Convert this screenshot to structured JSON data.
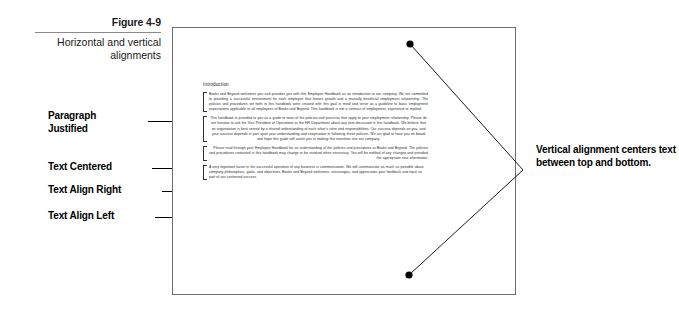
{
  "figure": {
    "number": "Figure 4-9",
    "title": "Horizontal and vertical alignments"
  },
  "callouts": {
    "left": [
      {
        "name": "paragraph-justified",
        "label": "Paragraph\nJustified"
      },
      {
        "name": "text-centered",
        "label": "Text Centered"
      },
      {
        "name": "text-align-right",
        "label": "Text Align Right"
      },
      {
        "name": "text-align-left",
        "label": "Text Align Left"
      }
    ],
    "right": {
      "label": "Vertical alignment centers text between top and bottom."
    }
  },
  "document": {
    "heading": "Introduction",
    "paragraphs": [
      {
        "alignment": "justify",
        "text": "Books and Beyond welcomes you and provides you with this Employee Handbook as an introduction to our company. We are committed to providing a successful environment for each employee that fosters growth and a mutually beneficial employment relationship. The policies and procedures set forth in this handbook were created with this goal in mind and serve as a guideline to basic employment expectations applicable to all employees of Books and Beyond. This handbook is not a contract of employment, expressed or implied."
      },
      {
        "alignment": "center",
        "text": "This handbook is provided to you as a guide to most of the policies and practices that apply to your employment relationship. Please do not hesitate to ask the Vice President of Operations or the HR Department about any item discussed in this handbook. We believe that an organization is best served by a shared understanding of each other's roles and responsibilities. Our success depends on you, and your success depends in part upon your understanding and cooperation in following these policies. We are glad to have you on board and hope this guide will assist you in making this transition into our company."
      },
      {
        "alignment": "right",
        "text": "Please read through your Employee Handbook for an understanding of the policies and procedures at Books and Beyond. The policies and procedures contained in this handbook may change or be revoked when necessary. You will be notified of any changes and provided the appropriate new information."
      },
      {
        "alignment": "left",
        "text": "A very important factor in the successful operation of any business is communication. We will communicate as much as possible about company philosophies, goals, and objectives. Books and Beyond welcomes, encourages, and appreciates your feedback and input as part of our continued success."
      }
    ]
  },
  "indicator": {
    "top_dot": {
      "x": 410,
      "y": 44
    },
    "bottom_dot": {
      "x": 409,
      "y": 275
    },
    "vertex": {
      "x": 523,
      "y": 170
    },
    "color": "#000000"
  },
  "frame": {
    "border_color": "#6e6e6e",
    "background": "#ffffff"
  }
}
